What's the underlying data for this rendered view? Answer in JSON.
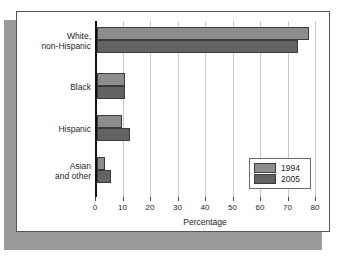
{
  "top_caption": "",
  "chart_data": {
    "type": "bar",
    "orientation": "horizontal",
    "title": "",
    "xlabel": "Percentage",
    "ylabel": "",
    "xlim": [
      0,
      80
    ],
    "xticks": [
      0,
      10,
      20,
      30,
      40,
      50,
      60,
      70,
      80
    ],
    "grid": true,
    "legend_position": "inside-right",
    "categories": [
      "White,\nnon-Hispanic",
      "Black",
      "Hispanic",
      "Asian\nand other"
    ],
    "series": [
      {
        "name": "1994",
        "color": "#8d8d8d",
        "values": [
          77,
          10,
          9,
          3
        ]
      },
      {
        "name": "2005",
        "color": "#636363",
        "values": [
          73,
          10,
          12,
          5
        ]
      }
    ]
  },
  "legend": {
    "items": [
      {
        "label": "1994"
      },
      {
        "label": "2005"
      }
    ]
  }
}
